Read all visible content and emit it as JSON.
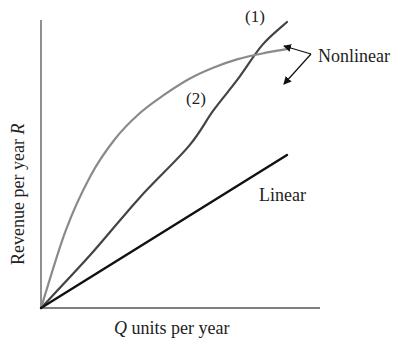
{
  "chart_data": {
    "type": "line",
    "title": "",
    "xlabel_prefix": "Q",
    "xlabel_rest": " units per year",
    "ylabel_prefix": "Revenue per year ",
    "ylabel_var": "R",
    "grid": false,
    "ticks": false,
    "xlim": [
      0,
      100
    ],
    "ylim": [
      0,
      100
    ],
    "series": [
      {
        "name": "(1)",
        "group": "Nonlinear",
        "color": "#444444",
        "x": [
          0,
          20,
          40,
          60,
          70,
          80,
          90,
          100
        ],
        "y": [
          0,
          18.5,
          38.5,
          56.5,
          69,
          80,
          92,
          100
        ]
      },
      {
        "name": "(2)",
        "group": "Nonlinear",
        "color": "#8a8a8a",
        "x": [
          0,
          10,
          20,
          30,
          40,
          50,
          60,
          70,
          80,
          90,
          100
        ],
        "y": [
          0,
          27,
          46,
          59,
          68,
          74.5,
          80,
          84,
          87,
          89,
          90.5
        ]
      },
      {
        "name": "Linear",
        "group": "Linear",
        "color": "#111111",
        "x": [
          0,
          100
        ],
        "y": [
          0,
          53.5
        ]
      }
    ],
    "annotations": [
      {
        "text": "(1)",
        "series": "(1)"
      },
      {
        "text": "(2)",
        "series": "(2)"
      },
      {
        "text": "Nonlinear",
        "arrows_to": [
          "(1)",
          "(2)"
        ]
      },
      {
        "text": "Linear",
        "series": "Linear"
      }
    ]
  },
  "labels": {
    "curve1": "(1)",
    "curve2": "(2)",
    "nonlinear": "Nonlinear",
    "linear": "Linear",
    "x_var": "Q",
    "x_rest": " units per year",
    "y_text": "Revenue per year ",
    "y_var": "R"
  },
  "colors": {
    "axis": "#555555",
    "curve1": "#444444",
    "curve2": "#8a8a8a",
    "linear": "#111111",
    "arrow": "#111111"
  }
}
